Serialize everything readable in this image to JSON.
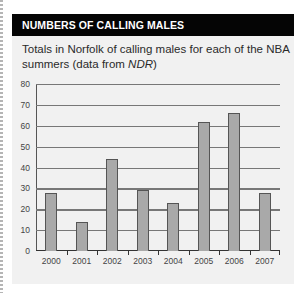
{
  "panel": {
    "header": "NUMBERS OF CALLING MALES",
    "subtitle_main": "Totals in Norfolk of calling males for each of the NBA summers",
    "subtitle_prefix": "(data from ",
    "subtitle_source": "NDR",
    "subtitle_suffix": ")"
  },
  "colors": {
    "header_bg": "#050505",
    "panel_bg": "#f1f1f1",
    "bar_fill": "#a9a9a9",
    "gridline": "#777777"
  },
  "chart_data": {
    "type": "bar",
    "title": "Totals in Norfolk of calling males for each of the NBA summers (data from NDR)",
    "xlabel": "",
    "ylabel": "",
    "categories": [
      "2000",
      "2001",
      "2002",
      "2003",
      "2004",
      "2005",
      "2006",
      "2007"
    ],
    "values": [
      28,
      14,
      44,
      29,
      23,
      62,
      66,
      28
    ],
    "ylim": [
      0,
      80
    ],
    "yticks": [
      "0",
      "10",
      "20",
      "30",
      "40",
      "50",
      "60",
      "70",
      "80"
    ],
    "grid": true,
    "legend": null
  }
}
